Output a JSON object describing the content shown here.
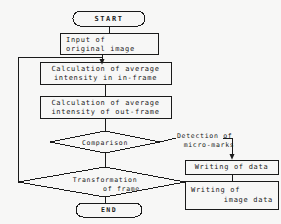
{
  "diagram": {
    "background_color": "#f7f7f6",
    "stroke_color": "#1a1a1a",
    "text_color": "#1a1a1a",
    "nodes": {
      "start": {
        "label": "START",
        "shape": "terminator"
      },
      "input_image": {
        "line1": "Input of",
        "line2": "original image",
        "shape": "process"
      },
      "calc_in_frame": {
        "line1": "Calculation of average",
        "line2": "intensity in in-frame",
        "shape": "process"
      },
      "calc_out_frame": {
        "line1": "Calculation of average",
        "line2": "intensity of out-frame",
        "shape": "process"
      },
      "comparison": {
        "label": "Comparison",
        "shape": "decision"
      },
      "transformation": {
        "line1": "Transformation",
        "line2": "of frame",
        "shape": "decision"
      },
      "end": {
        "label": "END",
        "shape": "terminator"
      },
      "writing_data": {
        "label": "Writing of data",
        "shape": "process"
      },
      "writing_image_data": {
        "line1": "Writing of",
        "line2": "image data",
        "shape": "process"
      }
    },
    "edge_labels": {
      "detection": {
        "line1": "Detection of",
        "line2": "micro-marks"
      }
    }
  }
}
